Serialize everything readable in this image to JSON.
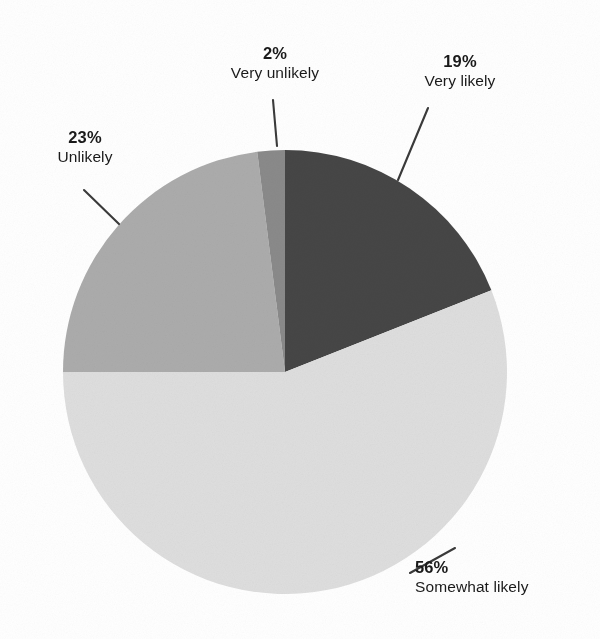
{
  "chart_data": {
    "type": "pie",
    "title": "",
    "subtitle": "",
    "xlabel": "",
    "ylabel": "",
    "legend_position": "none",
    "grid": false,
    "value_unit": "%",
    "start_angle_deg": 0,
    "direction": "clockwise",
    "categories": [
      "Very likely",
      "Somewhat likely",
      "Unlikely",
      "Very unlikely"
    ],
    "values": [
      19,
      56,
      23,
      2
    ],
    "slices": [
      {
        "label": "Very likely",
        "value": 19,
        "value_text": "19%",
        "color": "#464646",
        "start_deg": 0,
        "end_deg": 68.4
      },
      {
        "label": "Somewhat likely",
        "value": 56,
        "value_text": "56%",
        "color": "#dedede",
        "start_deg": 68.4,
        "end_deg": 270.0
      },
      {
        "label": "Unlikely",
        "value": 23,
        "value_text": "23%",
        "color": "#acacac",
        "start_deg": 270.0,
        "end_deg": 352.8
      },
      {
        "label": "Very unlikely",
        "value": 2,
        "value_text": "2%",
        "color": "#8a8a8a",
        "start_deg": 352.8,
        "end_deg": 360.0
      }
    ]
  },
  "labels": {
    "very_unlikely": {
      "pct": "2%",
      "cat": "Very unlikely"
    },
    "very_likely": {
      "pct": "19%",
      "cat": "Very likely"
    },
    "unlikely": {
      "pct": "23%",
      "cat": "Unlikely"
    },
    "somewhat_likely": {
      "pct": "56%",
      "cat": "Somewhat likely"
    }
  },
  "colors": {
    "very_likely": "#464646",
    "somewhat_likely": "#dedede",
    "unlikely": "#acacac",
    "very_unlikely": "#8a8a8a",
    "background": "#ffffff",
    "text": "#1a1a1a",
    "leader_line": "#3a3a3a"
  },
  "geometry": {
    "center_x": 285,
    "center_y": 372,
    "radius": 222
  }
}
